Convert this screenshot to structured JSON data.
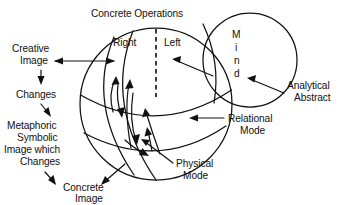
{
  "diagram": {
    "title": "Concrete Operations",
    "type": "venn-sphere-concept-diagram",
    "background_color": "#ffffff",
    "ink_color": "#111111",
    "labels": {
      "top_title": "Concrete Operations",
      "hemisphere_right": "Right",
      "hemisphere_left": "Left",
      "mind_letters": [
        "M",
        "i",
        "n",
        "d"
      ],
      "mind_word": "Mind",
      "analytical_abstract_line1": "Analytical",
      "analytical_abstract_line2": "Abstract",
      "relational_mode_line1": "Relational",
      "relational_mode_line2": "Mode",
      "physical_mode_line1": "Physical",
      "physical_mode_line2": "Mode",
      "creative_image_line1": "Creative",
      "creative_image_line2": "Image",
      "changes_top": "Changes",
      "metaphoric_line1": "Metaphoric",
      "metaphoric_line2": "Symbolic",
      "metaphoric_line3": "Image which",
      "metaphoric_line4": "Changes",
      "concrete_image_line1": "Concrete",
      "concrete_image_line2": "Image"
    },
    "shapes": {
      "main_sphere": {
        "name": "concrete-operations-sphere",
        "cx": 156,
        "cy": 104,
        "r": 76
      },
      "mind_circle": {
        "name": "mind-circle",
        "cx": 250,
        "cy": 60,
        "r": 47
      },
      "vertical_divider": {
        "name": "left-right-divider",
        "x": 156,
        "y1": 29,
        "y2": 96,
        "style": "dashed"
      },
      "latitude_arcs": [
        {
          "name": "relational-latitude-arc"
        },
        {
          "name": "physical-latitude-arc"
        }
      ],
      "longitude_arcs": [
        {
          "name": "longitude-arc-outer"
        },
        {
          "name": "longitude-arc-inner"
        }
      ]
    },
    "arrows": [
      {
        "name": "creative-image-double-arrow",
        "direction": "bidirectional",
        "from": "Creative Image",
        "to": "Right hemisphere"
      },
      {
        "name": "mind-to-left-arrow",
        "direction": "left",
        "from": "Mind circle",
        "to": "Left"
      },
      {
        "name": "analytical-abstract-leader",
        "direction": "up-left",
        "from": "Analytical Abstract",
        "to": "mind-circle edge"
      },
      {
        "name": "relational-mode-leader",
        "direction": "left",
        "from": "Relational Mode",
        "to": "sphere latitude arc"
      },
      {
        "name": "physical-mode-leader",
        "direction": "up-left",
        "from": "Physical Mode",
        "to": "sphere lower region"
      },
      {
        "name": "creative-to-changes-arrow",
        "direction": "down",
        "from": "Creative Image",
        "to": "Changes"
      },
      {
        "name": "changes-to-metaphoric-arrow",
        "direction": "down-right",
        "from": "Changes",
        "to": "Metaphoric Symbolic Image which Changes"
      },
      {
        "name": "metaphoric-to-concrete-arrow",
        "direction": "down-right",
        "from": "Metaphoric Symbolic",
        "to": "Concrete Image"
      },
      {
        "name": "concrete-image-leader",
        "direction": "up-right",
        "from": "Concrete Image",
        "to": "sphere lower region"
      },
      {
        "name": "internal-flow-arrow-up-1",
        "direction": "up",
        "location": "inside sphere"
      },
      {
        "name": "internal-flow-arrow-up-2",
        "direction": "up",
        "location": "inside sphere"
      },
      {
        "name": "internal-flow-arrow-down-1",
        "direction": "down",
        "location": "inside sphere"
      },
      {
        "name": "internal-flow-arrow-down-2",
        "direction": "down",
        "location": "inside sphere"
      },
      {
        "name": "internal-flow-arrow-diag-1",
        "direction": "down-right",
        "location": "inside sphere"
      },
      {
        "name": "internal-flow-arrow-diag-2",
        "direction": "up-right",
        "location": "inside sphere"
      }
    ]
  }
}
